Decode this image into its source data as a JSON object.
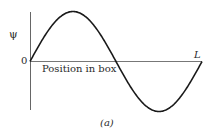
{
  "figure": {
    "y_label": "ψ",
    "origin_label": "0",
    "end_label": "L",
    "x_label": "Position in box",
    "caption": "(a)"
  },
  "chart_data": {
    "type": "line",
    "title": "",
    "xlabel": "Position in box",
    "ylabel": "ψ",
    "x_ticks": [
      "0",
      "L"
    ],
    "series": [
      {
        "name": "ψ (n=2)",
        "function": "sin(2πx/L)",
        "x": [
          0,
          0.25,
          0.5,
          0.75,
          1.0
        ],
        "values": [
          0,
          1,
          0,
          -1,
          0
        ]
      }
    ],
    "grid": false,
    "legend": "none"
  },
  "colors": {
    "curve": "#1a1a1a",
    "axis": "#555555",
    "text": "#2a2a2a"
  }
}
